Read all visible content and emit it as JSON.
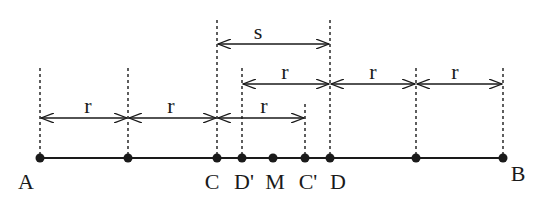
{
  "diagram": {
    "type": "number-line-intervals",
    "points": [
      {
        "id": "A",
        "label": "A",
        "x": 40
      },
      {
        "id": "P1",
        "label": "",
        "x": 128
      },
      {
        "id": "C",
        "label": "C",
        "x": 217
      },
      {
        "id": "Dp",
        "label": "D'",
        "x": 242
      },
      {
        "id": "M",
        "label": "M",
        "x": 273
      },
      {
        "id": "Cp",
        "label": "C'",
        "x": 305
      },
      {
        "id": "D",
        "label": "D",
        "x": 330
      },
      {
        "id": "P2",
        "label": "",
        "x": 416
      },
      {
        "id": "B",
        "label": "B",
        "x": 503
      }
    ],
    "intervals": [
      {
        "label": "s",
        "from": "C",
        "to": "D",
        "row": "top"
      },
      {
        "label": "r",
        "from": "D'",
        "to": "D",
        "row": "middle"
      },
      {
        "label": "r",
        "from": "D",
        "to": "P2",
        "row": "middle"
      },
      {
        "label": "r",
        "from": "P2",
        "to": "B",
        "row": "middle"
      },
      {
        "label": "r",
        "from": "A",
        "to": "P1",
        "row": "bottom"
      },
      {
        "label": "r",
        "from": "P1",
        "to": "C",
        "row": "bottom"
      },
      {
        "label": "r",
        "from": "C",
        "to": "C'",
        "row": "bottom"
      }
    ]
  },
  "labels": {
    "A": "A",
    "C": "C",
    "Dp": "D'",
    "M": "M",
    "Cp": "C'",
    "D": "D",
    "B": "B",
    "s": "s",
    "r": "r"
  }
}
